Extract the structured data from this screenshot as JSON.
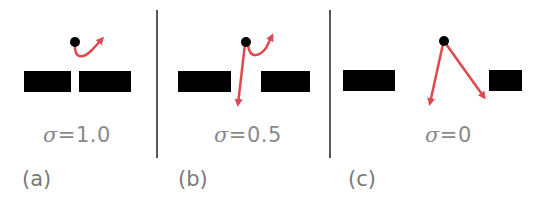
{
  "colors": {
    "arrow": "#e0484f",
    "bar": "#000000",
    "text": "#8a8a8a",
    "divider": "#222222"
  },
  "panels": [
    {
      "label": "(a)",
      "sigma_symbol": "σ",
      "sigma_value": "=1.0"
    },
    {
      "label": "(b)",
      "sigma_symbol": "σ",
      "sigma_value": "=0.5"
    },
    {
      "label": "(c)",
      "sigma_symbol": "σ",
      "sigma_value": "=0"
    }
  ]
}
